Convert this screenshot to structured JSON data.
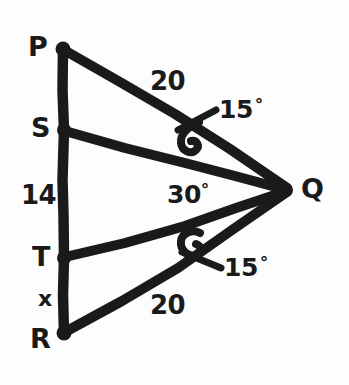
{
  "diagram": {
    "type": "geometry-figure",
    "stroke_color": "#1a1a1a",
    "background_color": "#fdfdfd",
    "vertices": [
      {
        "id": "P",
        "label": "P",
        "x": 63,
        "y": 49,
        "label_x": 28,
        "label_y": 33
      },
      {
        "id": "S",
        "label": "S",
        "x": 64,
        "y": 130,
        "label_x": 31,
        "label_y": 114
      },
      {
        "id": "T",
        "label": "T",
        "x": 64,
        "y": 258,
        "label_x": 32,
        "label_y": 243
      },
      {
        "id": "R",
        "label": "R",
        "x": 64,
        "y": 333,
        "label_x": 30,
        "label_y": 325
      },
      {
        "id": "Q",
        "label": "Q",
        "x": 287,
        "y": 190,
        "label_x": 301,
        "label_y": 175
      }
    ],
    "segments": [
      {
        "id": "PR",
        "from": "P",
        "to": "R"
      },
      {
        "id": "PQ",
        "from": "P",
        "to": "Q"
      },
      {
        "id": "SQ",
        "from": "S",
        "to": "Q"
      },
      {
        "id": "TQ",
        "from": "T",
        "to": "Q"
      },
      {
        "id": "RQ",
        "from": "R",
        "to": "Q"
      }
    ],
    "measures": [
      {
        "id": "pq-length",
        "text": "20",
        "x": 150,
        "y": 68,
        "for": "PQ"
      },
      {
        "id": "sr-length",
        "text": "14",
        "x": 21,
        "y": 182,
        "for": "S-to-T"
      },
      {
        "id": "rq-length",
        "text": "20",
        "x": 150,
        "y": 292,
        "for": "RQ"
      },
      {
        "id": "tr-unknown",
        "text": "x",
        "x": 38,
        "y": 288,
        "for": "TR"
      }
    ],
    "angles": [
      {
        "id": "angle-pqs",
        "value": "15",
        "symbol": "°",
        "x": 219,
        "y": 97,
        "arc_cx": 191,
        "arc_cy": 137
      },
      {
        "id": "angle-sqt",
        "value": "30",
        "symbol": "°",
        "x": 167,
        "y": 182,
        "arc_cx": 0,
        "arc_cy": 0
      },
      {
        "id": "angle-tqr",
        "value": "15",
        "symbol": "°",
        "x": 224,
        "y": 255,
        "arc_cx": 191,
        "arc_cy": 245
      }
    ]
  }
}
